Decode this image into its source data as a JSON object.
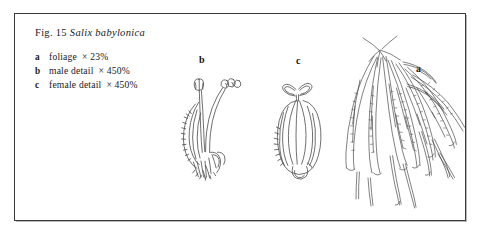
{
  "figure": {
    "caption_prefix": "Fig. 15",
    "species": "Salix babylonica",
    "legend": [
      {
        "key": "a",
        "description": "foliage",
        "scale": "× 23%"
      },
      {
        "key": "b",
        "description": "male detail",
        "scale": "× 450%"
      },
      {
        "key": "c",
        "description": "female detail",
        "scale": "× 450%"
      }
    ],
    "specimen_labels": {
      "foliage": "a",
      "male": "b",
      "female": "c"
    },
    "colors": {
      "ink": "#1a1a1a",
      "frame": "#3a3a3a",
      "paper": "#ffffff",
      "drawing_stroke": "#4a4a4a"
    }
  }
}
